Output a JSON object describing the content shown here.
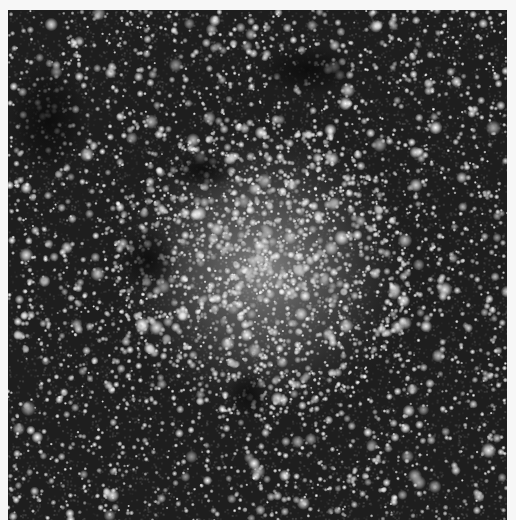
{
  "image": {
    "description": "Grayscale astronomical photograph of a dense star field with a bright central stellar concentration and dark dust lanes",
    "colors": {
      "background": "#f7f7f7",
      "sky_dark": "#1e1e1e",
      "glow": "#d8d8d8",
      "star": "#ffffff",
      "dust": "#0c0c0c"
    },
    "glow_center": {
      "x": 255,
      "y": 260,
      "radius": 150
    },
    "dust_lanes": [
      {
        "x": 195,
        "y": 160,
        "rx": 35,
        "ry": 20
      },
      {
        "x": 140,
        "y": 250,
        "rx": 30,
        "ry": 35
      },
      {
        "x": 240,
        "y": 385,
        "rx": 22,
        "ry": 25
      },
      {
        "x": 40,
        "y": 110,
        "rx": 40,
        "ry": 60
      },
      {
        "x": 300,
        "y": 60,
        "rx": 50,
        "ry": 25
      }
    ],
    "star_count": 4200
  }
}
